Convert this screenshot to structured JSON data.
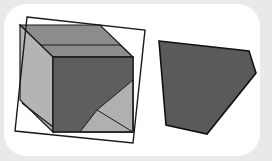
{
  "figure": {
    "colors": {
      "background": "#e9e9e9",
      "panel": "#ffffff",
      "stroke": "#1a1a1a",
      "cube_top": "#8c8c8c",
      "cube_left": "#b4b4b4",
      "cube_front": "#5e5e5e",
      "section_shaded": "#4f4f4f",
      "light_face": "#a8a8a8",
      "cross_section": "#5a5a5a"
    },
    "cutting_plane": {
      "points": "27,17 145,30 133,143 15,131"
    },
    "cube": {
      "top_face": "20,25 100,25 133,57 53,57",
      "left_face": "20,25 53,57 53,132 20,100",
      "front_face": "53,57 133,57 133,132 53,132",
      "section_in_front": "53,57 133,57 133,80 97,110 80,132 53,132",
      "lower_right_triangle": "97,110 133,80 133,132 80,132",
      "lower_left_triangle": "22,103 53,127 53,132 22,132"
    },
    "cross_section": {
      "points": "159,41 249,51 256,73 207,134 166,125"
    }
  }
}
